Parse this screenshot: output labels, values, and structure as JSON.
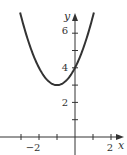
{
  "chart_data": {
    "type": "line",
    "title": "",
    "xlabel": "x",
    "ylabel": "y",
    "xlim": [
      -4,
      2.8
    ],
    "ylim": [
      -0.8,
      7.6
    ],
    "x_ticks": [
      -3,
      -2,
      -1,
      1,
      2
    ],
    "x_tick_labels": [
      {
        "value": -2,
        "label": "−2"
      },
      {
        "value": 2,
        "label": "2"
      }
    ],
    "y_ticks": [
      1,
      2,
      3,
      4,
      5,
      6
    ],
    "y_tick_labels": [
      {
        "value": 2,
        "label": "2"
      },
      {
        "value": 4,
        "label": "4"
      },
      {
        "value": 6,
        "label": "6"
      }
    ],
    "grid": false,
    "legend": null,
    "series": [
      {
        "name": "y = x^2 + 2x + 4",
        "expression": "x^2 + 2x + 4",
        "vertex": [
          -1,
          3
        ],
        "y_intercept": 4,
        "x": [
          -3.5,
          -3,
          -2.5,
          -2,
          -1.5,
          -1,
          -0.5,
          0,
          0.5,
          1,
          1.5
        ],
        "values": [
          9.25,
          7,
          5.25,
          4,
          3.25,
          3,
          3.25,
          4,
          5.25,
          7,
          9.25
        ]
      }
    ]
  },
  "axes": {
    "x_label": "x",
    "y_label": "y",
    "x_tick_labels": [
      "−2",
      "2"
    ],
    "y_tick_labels": [
      "2",
      "4",
      "6"
    ]
  }
}
